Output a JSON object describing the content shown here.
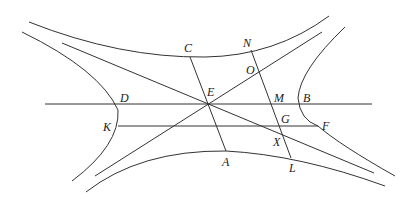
{
  "diagram": {
    "stroke_color": "#333333",
    "labels": [
      {
        "id": "C",
        "text": "C",
        "x": 184,
        "y": 42
      },
      {
        "id": "N",
        "text": "N",
        "x": 243,
        "y": 37
      },
      {
        "id": "O",
        "text": "O",
        "x": 246,
        "y": 64
      },
      {
        "id": "E",
        "text": "E",
        "x": 208,
        "y": 86
      },
      {
        "id": "D",
        "text": "D",
        "x": 120,
        "y": 92
      },
      {
        "id": "M",
        "text": "M",
        "x": 275,
        "y": 92
      },
      {
        "id": "B",
        "text": "B",
        "x": 302,
        "y": 92
      },
      {
        "id": "K",
        "text": "K",
        "x": 102,
        "y": 120
      },
      {
        "id": "G",
        "text": "G",
        "x": 281,
        "y": 113
      },
      {
        "id": "F",
        "text": "F",
        "x": 322,
        "y": 119
      },
      {
        "id": "X",
        "text": "X",
        "x": 273,
        "y": 135
      },
      {
        "id": "A",
        "text": "A",
        "x": 222,
        "y": 155
      },
      {
        "id": "L",
        "text": "L",
        "x": 289,
        "y": 162
      }
    ]
  }
}
